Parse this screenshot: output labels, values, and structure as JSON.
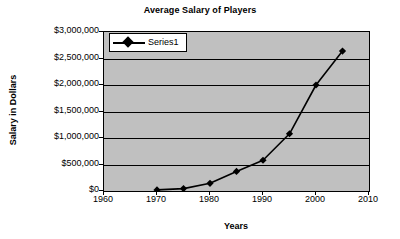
{
  "chart_data": {
    "type": "line",
    "title": "Average Salary of Players",
    "xlabel": "Years",
    "ylabel": "Salary in Dollars",
    "xlim": [
      1960,
      2010
    ],
    "ylim": [
      0,
      3000000
    ],
    "grid": "horizontal",
    "legend_position": "top-left-inside",
    "plot_background": "#c0c0c0",
    "series_color": "#000000",
    "marker": "diamond",
    "x_ticks": [
      1960,
      1970,
      1980,
      1990,
      2000,
      2010
    ],
    "x_tick_labels": [
      "1960",
      "1970",
      "1980",
      "1990",
      "2000",
      "2010"
    ],
    "y_ticks": [
      0,
      500000,
      1000000,
      1500000,
      2000000,
      2500000,
      3000000
    ],
    "y_tick_labels": [
      "$0",
      "$500,000",
      "$1,000,000",
      "$1,500,000",
      "$2,000,000",
      "$2,500,000",
      "$3,000,000"
    ],
    "series": [
      {
        "name": "Series1",
        "x": [
          1970,
          1975,
          1980,
          1985,
          1990,
          1995,
          2000,
          2005
        ],
        "values": [
          20000,
          45000,
          145000,
          370000,
          580000,
          1080000,
          2000000,
          2640000
        ]
      }
    ]
  },
  "legend": {
    "entries": [
      {
        "label": "Series1"
      }
    ]
  }
}
